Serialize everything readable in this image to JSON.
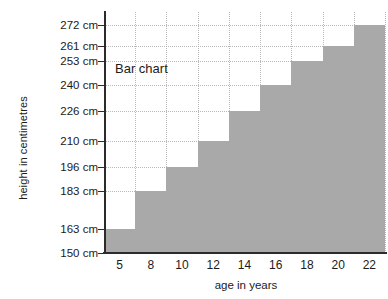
{
  "chart_data": {
    "type": "bar",
    "title": "",
    "annotation": "Bar chart",
    "xlabel": "age in years",
    "ylabel": "height in centimetres",
    "categories": [
      "5",
      "8",
      "10",
      "12",
      "14",
      "16",
      "18",
      "20",
      "22"
    ],
    "values": [
      163,
      183,
      196,
      210,
      226,
      240,
      253,
      261,
      272
    ],
    "y_tick_labels": [
      "150 cm",
      "163 cm",
      "183 cm",
      "196 cm",
      "210 cm",
      "226 cm",
      "240 cm",
      "253 cm",
      "261 cm",
      "272 cm"
    ],
    "y_tick_values": [
      150,
      163,
      183,
      196,
      210,
      226,
      240,
      253,
      261,
      272
    ],
    "x_tick_labels": [
      "5",
      "8",
      "10",
      "12",
      "14",
      "16",
      "18",
      "20",
      "22"
    ],
    "ylim": [
      150,
      279
    ],
    "xlim": [
      0,
      9
    ],
    "grid": true,
    "legend": null,
    "bar_color": "#a9a9a9",
    "axis_color": "#2b2b2b",
    "grid_color": "#b9b9b9",
    "text_color": "#1b1b1b",
    "background_color": "#ffffff"
  }
}
